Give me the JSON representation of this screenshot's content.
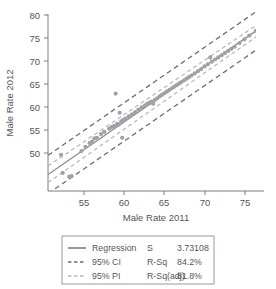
{
  "chart_data": {
    "type": "scatter",
    "title": "",
    "xlabel": "Male Rate 2011",
    "ylabel": "Male Rate 2012",
    "xlim": [
      50.5,
      77.0
    ],
    "ylim": [
      46.5,
      80.5
    ],
    "xticks": [
      55,
      60,
      65,
      70,
      75
    ],
    "xtick_labels": [
      "55",
      "60",
      "65",
      "70",
      "75"
    ],
    "yticks": [
      50,
      55,
      60,
      65,
      70,
      75,
      80
    ],
    "ytick_labels": [
      "50",
      "55",
      "60",
      "65",
      "70",
      "75",
      "80"
    ],
    "grid": false,
    "legend_position": "below-plot",
    "series": [
      {
        "name": "Data",
        "type": "scatter",
        "points": [
          [
            52.1,
            53.3
          ],
          [
            52.3,
            49.9
          ],
          [
            53.1,
            49.2
          ],
          [
            53.4,
            49.3
          ],
          [
            54.6,
            54.0
          ],
          [
            55.1,
            54.8
          ],
          [
            55.6,
            55.5
          ],
          [
            55.9,
            55.8
          ],
          [
            56.2,
            56.4
          ],
          [
            56.5,
            56.5
          ],
          [
            57.0,
            57.2
          ],
          [
            57.4,
            57.6
          ],
          [
            58.0,
            58.2
          ],
          [
            58.3,
            58.5
          ],
          [
            58.6,
            58.7
          ],
          [
            58.8,
            64.8
          ],
          [
            58.9,
            58.9
          ],
          [
            59.0,
            59.1
          ],
          [
            59.2,
            59.0
          ],
          [
            59.3,
            61.2
          ],
          [
            59.5,
            59.6
          ],
          [
            59.6,
            56.5
          ],
          [
            59.7,
            59.8
          ],
          [
            60.0,
            60.1
          ],
          [
            60.4,
            60.5
          ],
          [
            60.8,
            60.9
          ],
          [
            61.2,
            61.3
          ],
          [
            61.6,
            61.8
          ],
          [
            62.0,
            62.2
          ],
          [
            62.4,
            62.6
          ],
          [
            62.7,
            62.9
          ],
          [
            63.0,
            63.1
          ],
          [
            63.2,
            63.3
          ],
          [
            63.4,
            62.9
          ],
          [
            63.6,
            63.6
          ],
          [
            63.9,
            63.9
          ],
          [
            64.2,
            64.3
          ],
          [
            64.5,
            64.6
          ],
          [
            64.8,
            64.9
          ],
          [
            65.1,
            65.2
          ],
          [
            65.4,
            65.5
          ],
          [
            65.7,
            65.8
          ],
          [
            66.0,
            66.1
          ],
          [
            66.3,
            66.4
          ],
          [
            66.6,
            66.7
          ],
          [
            66.9,
            67.0
          ],
          [
            67.2,
            67.3
          ],
          [
            67.5,
            67.6
          ],
          [
            67.8,
            67.9
          ],
          [
            68.1,
            68.2
          ],
          [
            68.5,
            68.6
          ],
          [
            68.9,
            69.0
          ],
          [
            69.3,
            69.4
          ],
          [
            69.7,
            69.9
          ],
          [
            70.1,
            70.3
          ],
          [
            70.4,
            71.6
          ],
          [
            70.6,
            70.8
          ],
          [
            71.0,
            71.2
          ],
          [
            71.4,
            71.6
          ],
          [
            71.8,
            72.0
          ],
          [
            72.2,
            72.4
          ],
          [
            72.6,
            72.8
          ],
          [
            73.0,
            73.2
          ],
          [
            73.4,
            73.6
          ],
          [
            74.0,
            74.3
          ],
          [
            74.6,
            75.0
          ],
          [
            75.2,
            75.7
          ],
          [
            76.0,
            76.6
          ]
        ]
      },
      {
        "name": "Regression",
        "type": "line",
        "style": "solid",
        "endpoints": [
          [
            50.5,
            49.6
          ],
          [
            77.0,
            77.6
          ]
        ]
      },
      {
        "name": "95% CI upper",
        "type": "line",
        "style": "dashed-light",
        "endpoints": [
          [
            50.5,
            51.2
          ],
          [
            77.0,
            78.6
          ]
        ]
      },
      {
        "name": "95% CI lower",
        "type": "line",
        "style": "dashed-light",
        "endpoints": [
          [
            50.5,
            48.1
          ],
          [
            77.0,
            76.5
          ]
        ]
      },
      {
        "name": "95% PI upper",
        "type": "line",
        "style": "dashed-dark",
        "endpoints": [
          [
            50.5,
            53.2
          ],
          [
            77.0,
            81.2
          ]
        ]
      },
      {
        "name": "95% PI lower",
        "type": "line",
        "style": "dashed-dark",
        "endpoints": [
          [
            50.5,
            46.0
          ],
          [
            77.0,
            74.0
          ]
        ]
      }
    ]
  },
  "legend": {
    "rows": [
      {
        "swatch": "solid",
        "label": "Regression",
        "stat_name": "S",
        "stat_value": "3.73108"
      },
      {
        "swatch": "dashed-dark",
        "label": "95% CI",
        "stat_name": "R-Sq",
        "stat_value": "84.2%"
      },
      {
        "swatch": "dashed-light",
        "label": "95% PI",
        "stat_name": "R-Sq(adj)",
        "stat_value": "81.8%"
      }
    ]
  },
  "colors": {
    "regression": "#8e8e93",
    "ci": "#b4b4ba",
    "pi": "#6e6e73",
    "points": "#a0a0a6",
    "axis": "#7d7d82",
    "text": "#55555a"
  }
}
